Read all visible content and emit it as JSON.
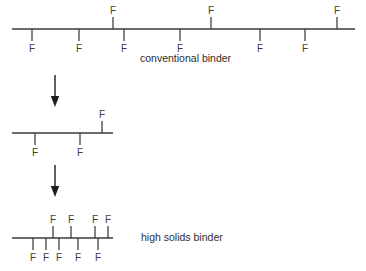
{
  "figure": {
    "background_color": "#ffffff",
    "line_color": "#3a3a3a",
    "text_color": "#3d3d3d",
    "arrow_color": "#1f1f1f",
    "width": 366,
    "height": 271
  },
  "captions": {
    "conventional": "conventional binder",
    "high_solids": "high solids binder"
  },
  "branch_symbol": "F",
  "chains": [
    {
      "id": "chain-conventional",
      "name": "conventional binder chain",
      "caption": "conventional binder",
      "caption_x": 140,
      "caption_y": 62,
      "backbone": {
        "x1": 12,
        "x2": 355,
        "y": 29
      },
      "branch_count": 9,
      "branches_below": [
        {
          "x": 32,
          "label": "F"
        },
        {
          "x": 79,
          "label": "F"
        },
        {
          "x": 124,
          "label": "F"
        },
        {
          "x": 180,
          "label": "F"
        },
        {
          "x": 260,
          "label": "F"
        },
        {
          "x": 305,
          "label": "F"
        }
      ],
      "branches_above": [
        {
          "x": 113,
          "label": "F"
        },
        {
          "x": 211,
          "label": "F"
        },
        {
          "x": 337,
          "label": "F"
        }
      ]
    },
    {
      "id": "chain-intermediate",
      "name": "intermediate shortened chain",
      "caption": "",
      "backbone": {
        "x1": 12,
        "x2": 113,
        "y": 133
      },
      "branch_count": 3,
      "branches_below": [
        {
          "x": 35,
          "label": "F"
        },
        {
          "x": 80,
          "label": "F"
        }
      ],
      "branches_above": [
        {
          "x": 102,
          "label": "F"
        }
      ]
    },
    {
      "id": "chain-high-solids",
      "name": "high solids binder chain",
      "caption": "high solids binder",
      "caption_x": 141,
      "caption_y": 241,
      "backbone": {
        "x1": 12,
        "x2": 113,
        "y": 238
      },
      "branch_count": 10,
      "branches_below": [
        {
          "x": 33,
          "label": "F"
        },
        {
          "x": 46,
          "label": "F"
        },
        {
          "x": 59,
          "label": "F"
        },
        {
          "x": 78,
          "label": "F"
        },
        {
          "x": 98,
          "label": "F"
        }
      ],
      "branches_above": [
        {
          "x": 53,
          "label": "F"
        },
        {
          "x": 71,
          "label": "F"
        },
        {
          "x": 95,
          "label": "F"
        },
        {
          "x": 108,
          "label": "F"
        }
      ]
    }
  ],
  "arrows": [
    {
      "id": "arrow-step-1",
      "name": "transformation arrow one",
      "x": 55,
      "y1": 75,
      "y2": 107,
      "direction": "down"
    },
    {
      "id": "arrow-step-2",
      "name": "transformation arrow two",
      "x": 55,
      "y1": 165,
      "y2": 197,
      "direction": "down"
    }
  ],
  "geometry": {
    "tick_length_below": 12,
    "tick_length_above": 12,
    "label_offset_below": 23,
    "label_offset_above": 16,
    "arrow_head_half_width": 4.2,
    "arrow_head_length": 11
  }
}
